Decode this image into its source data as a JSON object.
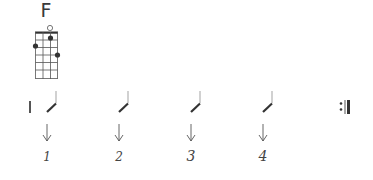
{
  "chord": {
    "name": "F",
    "strings": 4,
    "frets": 6,
    "open_strings": [
      3
    ],
    "fingering": [
      {
        "string": 3,
        "fret": 1
      },
      {
        "string": 1,
        "fret": 2
      },
      {
        "string": 4,
        "fret": 3
      }
    ]
  },
  "measure": {
    "start_bar": "single",
    "end_bar": "repeat-end",
    "beats": [
      {
        "number": "1",
        "stroke": "down",
        "icon": "down-arrow-icon"
      },
      {
        "number": "2",
        "stroke": "down",
        "icon": "down-arrow-icon"
      },
      {
        "number": "3",
        "stroke": "down",
        "icon": "down-arrow-icon"
      },
      {
        "number": "4",
        "stroke": "down",
        "icon": "down-arrow-icon"
      }
    ]
  },
  "colors": {
    "ink": "#3a3a3a",
    "light_ink": "#9a9a9a"
  }
}
